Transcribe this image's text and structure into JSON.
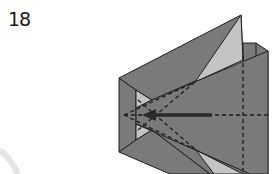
{
  "step": {
    "number": "18"
  },
  "diagram": {
    "colors": {
      "paper_dark": "#7a7a7a",
      "paper_light": "#c4c4c4",
      "outline": "#1e1e1e",
      "background": "#ffffff",
      "decor_arc": "#e6e6e6"
    },
    "annotations": {
      "fold_lines": "dashed valley fold lines",
      "arrow": "push-in arrow pointing left"
    }
  }
}
